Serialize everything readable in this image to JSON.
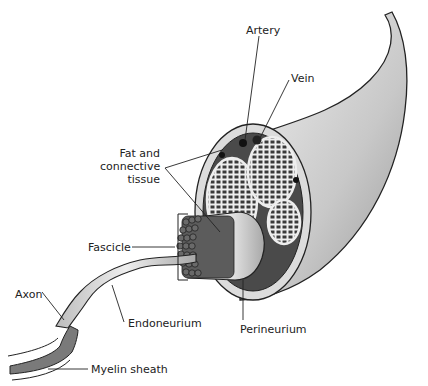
{
  "diagram": {
    "labels": {
      "artery": "Artery",
      "vein": "Vein",
      "fat_line1": "Fat and",
      "fat_line2": "connective",
      "fat_line3": "tissue",
      "fascicle": "Fascicle",
      "axon": "Axon",
      "endoneurium": "Endoneurium",
      "perineurium": "Perineurium",
      "myelin_sheath": "Myelin sheath"
    },
    "colors": {
      "outline": "#222222",
      "epineurium": "#d9d9d9",
      "fascicle_fill": "#8a8a8a",
      "background": "#ffffff"
    }
  }
}
